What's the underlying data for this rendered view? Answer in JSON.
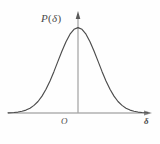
{
  "figure": {
    "name": "probability-density-gaussian",
    "background_color": "#fefefe",
    "curve_color": "#4c4c4c",
    "axis_color": "#8a8a8a",
    "label_color": "#4a4a4a"
  },
  "labels": {
    "y_axis": "P",
    "y_axis_arg_open": "(",
    "y_axis_arg": "δ",
    "y_axis_arg_close": ")",
    "y_axis_full": "P(δ)",
    "origin": "O",
    "x_axis": "δ"
  },
  "chart_data": {
    "type": "line",
    "title": "",
    "subtitle": "",
    "xlabel": "δ",
    "ylabel": "P(δ)",
    "grid": false,
    "legend_position": "none",
    "annotations": [
      {
        "text": "P(δ)",
        "position": "y-axis-top-left",
        "role": "y-axis-label"
      },
      {
        "text": "O",
        "position": "origin-below-left",
        "role": "origin-label"
      },
      {
        "text": "δ",
        "position": "x-axis-right-end",
        "role": "x-axis-label"
      }
    ],
    "axes": {
      "x": {
        "label": "δ",
        "arrow": true,
        "ticks": [],
        "tick_labels": [],
        "range": [
          -3.5,
          3.7
        ],
        "origin_at": 0
      },
      "y": {
        "label": "P(δ)",
        "arrow": true,
        "ticks": [],
        "tick_labels": [],
        "range": [
          0,
          1.1
        ]
      }
    },
    "series": [
      {
        "name": "P(δ)",
        "description": "symmetric bell-shaped normal (Gaussian) probability density curve, peak centered on the y-axis at δ = 0",
        "function": "gaussian",
        "mean": 0,
        "sigma": 1,
        "peak_value": 1.0,
        "x": [
          -3.5,
          -3.2,
          -3.0,
          -2.8,
          -2.6,
          -2.4,
          -2.2,
          -2.0,
          -1.8,
          -1.6,
          -1.4,
          -1.2,
          -1.0,
          -0.8,
          -0.6,
          -0.4,
          -0.2,
          0.0,
          0.2,
          0.4,
          0.6,
          0.8,
          1.0,
          1.2,
          1.4,
          1.6,
          1.8,
          2.0,
          2.2,
          2.4,
          2.6,
          2.8,
          3.0,
          3.2,
          3.5
        ],
        "values": [
          0.002,
          0.006,
          0.011,
          0.02,
          0.034,
          0.056,
          0.089,
          0.135,
          0.198,
          0.278,
          0.375,
          0.487,
          0.607,
          0.726,
          0.835,
          0.923,
          0.98,
          1.0,
          0.98,
          0.923,
          0.835,
          0.726,
          0.607,
          0.487,
          0.375,
          0.278,
          0.198,
          0.135,
          0.089,
          0.056,
          0.034,
          0.02,
          0.011,
          0.006,
          0.002
        ]
      }
    ]
  }
}
